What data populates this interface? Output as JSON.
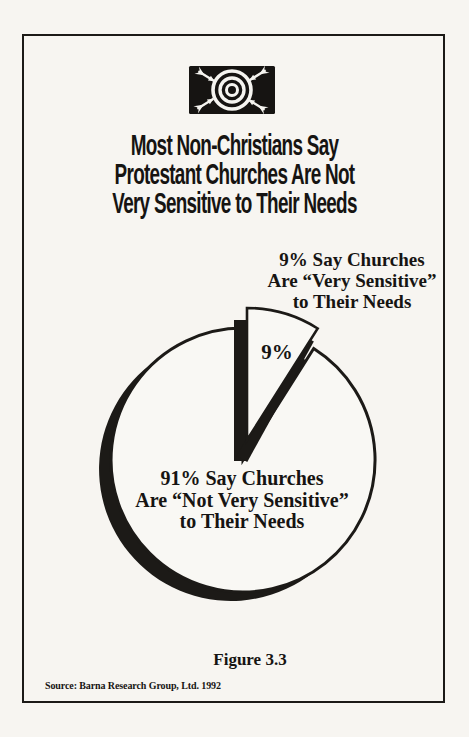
{
  "colors": {
    "background": "#f7f5f1",
    "paper": "#f9f8f4",
    "ink": "#1c1a17"
  },
  "header": {
    "logo": {
      "name": "bullseye-target-with-darts",
      "plate_color": "#161412",
      "dart_count": 4
    },
    "title_lines": [
      "Most Non-Christians Say",
      "Protestant Churches Are Not",
      "Very Sensitive to Their Needs"
    ]
  },
  "chart_data": {
    "type": "pie",
    "title": "Most Non-Christians Say Protestant Churches Are Not Very Sensitive to Their Needs",
    "unit": "percent",
    "categories": [
      "Very Sensitive",
      "Not Very Sensitive"
    ],
    "values": [
      9,
      91
    ],
    "start_angle_deg": 0,
    "legend_position": "none",
    "style": "monochrome exploded pie with offset black drop shadow",
    "slices": [
      {
        "value": 9,
        "inner_label": "9%",
        "exploded": true,
        "label_lines": [
          "9% Say Churches",
          "Are “Very Sensitive”",
          "to Their Needs"
        ]
      },
      {
        "value": 91,
        "exploded": false,
        "label_lines": [
          "91% Say Churches",
          "Are “Not Very Sensitive”",
          "to Their Needs"
        ]
      }
    ]
  },
  "figure": {
    "caption": "Figure 3.3",
    "source": "Source: Barna Research Group, Ltd. 1992"
  }
}
